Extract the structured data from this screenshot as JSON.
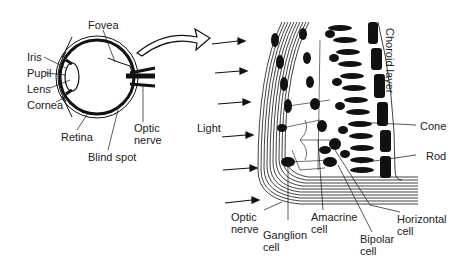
{
  "eye_labels": {
    "fovea": "Fovea",
    "iris": "Iris",
    "pupil": "Pupil",
    "lens": "Lens",
    "cornea": "Cornea",
    "retina": "Retina",
    "blind_spot": "Blind spot",
    "optic_nerve_1": "Optic",
    "optic_nerve_2": "nerve"
  },
  "retina_labels": {
    "light": "Light",
    "choroid": "Choroid layer",
    "cone": "Cone",
    "rod": "Rod",
    "optic_nerve_1": "Optic",
    "optic_nerve_2": "nerve",
    "ganglion_1": "Ganglion",
    "ganglion_2": "cell",
    "amacrine_1": "Amacrine",
    "amacrine_2": "cell",
    "bipolar_1": "Bipolar",
    "bipolar_2": "cell",
    "horizontal_1": "Horizontal",
    "horizontal_2": "cell"
  },
  "colors": {
    "ink": "#111111",
    "background": "#ffffff"
  }
}
